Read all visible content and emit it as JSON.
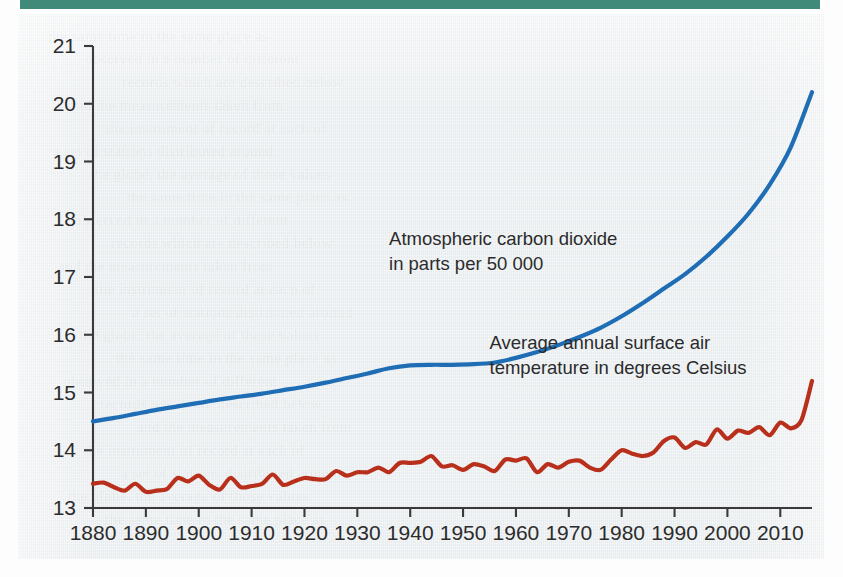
{
  "page": {
    "top_rule_color": "#3f8a79",
    "paper_color": "#edf1f3",
    "ghost_text": [
      "the same time in the same place as",
      "observed in a number of different",
      "records which are described below",
      "and the measurements taken from",
      "the instrument of record at each of",
      "a set of stations distributed around",
      "the globe, the average of those values"
    ]
  },
  "chart_data": {
    "type": "line",
    "title": "",
    "subtitle": "",
    "xlabel": "",
    "ylabel": "",
    "grid": false,
    "legend_position": "inline-annotations",
    "xlim": [
      1880,
      2016
    ],
    "ylim": [
      13,
      21
    ],
    "x_ticks": [
      1880,
      1890,
      1900,
      1910,
      1920,
      1930,
      1940,
      1950,
      1960,
      1970,
      1980,
      1990,
      2000,
      2010
    ],
    "x_tick_labels": [
      "1880",
      "1890",
      "1900",
      "1910",
      "1920",
      "1930",
      "1940",
      "1950",
      "1960",
      "1970",
      "1980",
      "1990",
      "2000",
      "2010"
    ],
    "y_ticks": [
      13,
      14,
      15,
      16,
      17,
      18,
      19,
      20,
      21
    ],
    "y_tick_labels": [
      "13",
      "14",
      "15",
      "16",
      "17",
      "18",
      "19",
      "20",
      "21"
    ],
    "annotations": [
      {
        "name": "co2-annotation",
        "lines": [
          "Atmospheric carbon dioxide",
          "in parts per 50 000"
        ],
        "x": 1936,
        "y": 17.55,
        "color": "#2b2b2b"
      },
      {
        "name": "temperature-annotation",
        "lines": [
          "Average annual surface air",
          "temperature in degrees Celsius"
        ],
        "x": 1955,
        "y": 15.75,
        "color": "#2b2b2b"
      }
    ],
    "series": [
      {
        "name": "Atmospheric carbon dioxide in parts per 50 000",
        "short_name": "co2",
        "color": "#1f6db4",
        "stroke_width": 4.2,
        "x": [
          1880,
          1884,
          1888,
          1892,
          1896,
          1900,
          1904,
          1908,
          1912,
          1916,
          1920,
          1924,
          1928,
          1932,
          1936,
          1940,
          1944,
          1948,
          1952,
          1956,
          1960,
          1964,
          1968,
          1972,
          1976,
          1980,
          1984,
          1988,
          1992,
          1996,
          2000,
          2004,
          2008,
          2012,
          2016
        ],
        "values": [
          14.5,
          14.56,
          14.63,
          14.7,
          14.76,
          14.82,
          14.88,
          14.93,
          14.98,
          15.04,
          15.1,
          15.17,
          15.25,
          15.33,
          15.42,
          15.47,
          15.48,
          15.48,
          15.49,
          15.52,
          15.6,
          15.7,
          15.82,
          15.96,
          16.12,
          16.32,
          16.55,
          16.8,
          17.05,
          17.35,
          17.7,
          18.1,
          18.6,
          19.25,
          20.2
        ]
      },
      {
        "name": "Average annual surface air temperature in degrees Celsius",
        "short_name": "temperature",
        "color": "#b8301c",
        "stroke_width": 4.2,
        "x": [
          1880,
          1882,
          1884,
          1886,
          1888,
          1890,
          1892,
          1894,
          1896,
          1898,
          1900,
          1902,
          1904,
          1906,
          1908,
          1910,
          1912,
          1914,
          1916,
          1918,
          1920,
          1922,
          1924,
          1926,
          1928,
          1930,
          1932,
          1934,
          1936,
          1938,
          1940,
          1942,
          1944,
          1946,
          1948,
          1950,
          1952,
          1954,
          1956,
          1958,
          1960,
          1962,
          1964,
          1966,
          1968,
          1970,
          1972,
          1974,
          1976,
          1978,
          1980,
          1982,
          1984,
          1986,
          1988,
          1990,
          1992,
          1994,
          1996,
          1998,
          2000,
          2002,
          2004,
          2006,
          2008,
          2010,
          2012,
          2014,
          2016
        ],
        "values": [
          13.42,
          13.44,
          13.36,
          13.3,
          13.42,
          13.28,
          13.3,
          13.33,
          13.52,
          13.46,
          13.56,
          13.4,
          13.32,
          13.52,
          13.36,
          13.38,
          13.42,
          13.58,
          13.4,
          13.46,
          13.52,
          13.5,
          13.5,
          13.64,
          13.56,
          13.62,
          13.62,
          13.7,
          13.62,
          13.78,
          13.78,
          13.8,
          13.9,
          13.72,
          13.74,
          13.66,
          13.76,
          13.72,
          13.64,
          13.84,
          13.82,
          13.86,
          13.62,
          13.76,
          13.7,
          13.8,
          13.82,
          13.7,
          13.66,
          13.84,
          14.0,
          13.94,
          13.9,
          13.96,
          14.16,
          14.22,
          14.04,
          14.14,
          14.1,
          14.36,
          14.2,
          14.34,
          14.3,
          14.4,
          14.26,
          14.48,
          14.38,
          14.52,
          15.2
        ]
      }
    ]
  }
}
